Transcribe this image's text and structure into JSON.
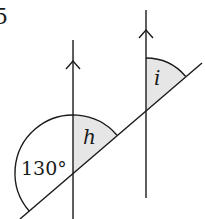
{
  "diagram": {
    "type": "parallel-lines-transversal",
    "partial_label_top_left": "5",
    "angles": {
      "given": {
        "label": "130°",
        "value": 130
      },
      "h": {
        "label": "h",
        "shaded": true
      },
      "i": {
        "label": "i",
        "shaded": true
      }
    },
    "colors": {
      "line": "#1a1a1a",
      "shade": "#e6e6e6",
      "background": "#ffffff"
    },
    "geometry": {
      "left_parallel": {
        "x": 73,
        "y_top": 40,
        "y_bottom": 219,
        "arrow_y": 62
      },
      "right_parallel": {
        "x": 146,
        "y_top": 10,
        "y_bottom": 198,
        "arrow_y": 30
      },
      "transversal": {
        "x1": 20,
        "y1": 219,
        "x2": 202,
        "y2": 63
      },
      "left_intersection": {
        "x": 73,
        "y": 173
      },
      "right_intersection": {
        "x": 146,
        "y": 110
      }
    }
  }
}
